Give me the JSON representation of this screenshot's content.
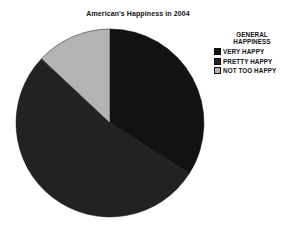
{
  "title": "American's Happiness in 2004",
  "legend": {
    "title_line1": "GENERAL",
    "title_line2": "HAPPINESS",
    "items": [
      {
        "label": "VERY HAPPY"
      },
      {
        "label": "PRETTY HAPPY"
      },
      {
        "label": "NOT TOO HAPPY"
      }
    ]
  },
  "chart_data": {
    "type": "pie",
    "title": "American's Happiness in 2004",
    "categories": [
      "VERY HAPPY",
      "PRETTY HAPPY",
      "NOT TOO HAPPY"
    ],
    "values": [
      34,
      53,
      13
    ],
    "values_note": "percent, estimated from slice angles (approx 122°, 191°, 47°)",
    "start_angle_deg": 0,
    "direction": "clockwise",
    "colors": [
      "#121212",
      "#222222",
      "#b3b3b3"
    ],
    "legend_title": "GENERAL HAPPINESS",
    "legend_position": "right",
    "data_labels_shown": false
  }
}
